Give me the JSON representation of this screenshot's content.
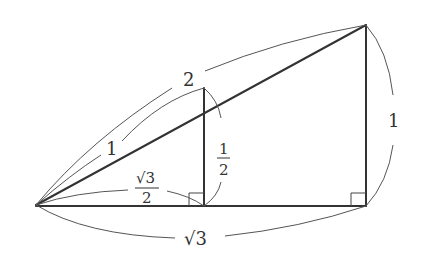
{
  "diagram": {
    "points": {
      "A": [
        36,
        205
      ],
      "B": [
        366,
        25
      ],
      "C": [
        366,
        206
      ],
      "D": [
        204,
        88
      ],
      "E": [
        204,
        206
      ]
    },
    "labels": {
      "hypotenuse_large": "2",
      "hypotenuse_small": "1",
      "vertical_large": "1",
      "vertical_small_num": "1",
      "vertical_small_den": "2",
      "base_small_num": "√3",
      "base_small_den": "2",
      "base_large": "√3"
    },
    "colors": {
      "line": "#333333",
      "arc": "#555555",
      "text": "#333333"
    }
  }
}
